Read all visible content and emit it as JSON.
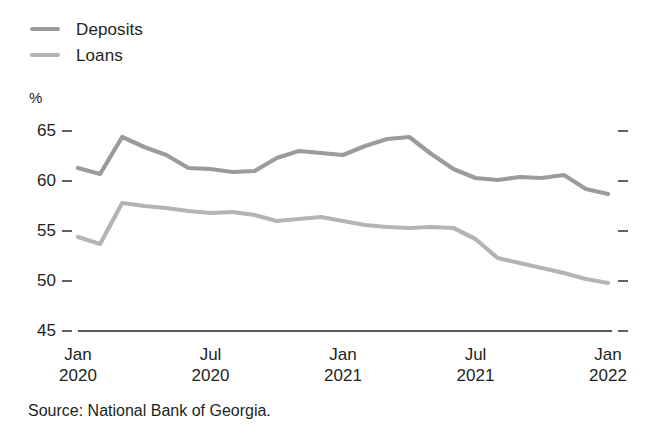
{
  "chart_data": {
    "type": "line",
    "title": "",
    "subtitle": "",
    "xlabel": "",
    "ylabel": "%",
    "unit_label": "%",
    "ylim": [
      45,
      65
    ],
    "yticks": [
      45,
      50,
      55,
      60,
      65
    ],
    "ytick_labels": [
      "45",
      "50",
      "55",
      "60",
      "65"
    ],
    "grid": false,
    "legend_position": "top-left",
    "right_axis_ticks": true,
    "x": [
      "Jan 2020",
      "Feb 2020",
      "Mar 2020",
      "Apr 2020",
      "May 2020",
      "Jun 2020",
      "Jul 2020",
      "Aug 2020",
      "Sep 2020",
      "Oct 2020",
      "Nov 2020",
      "Dec 2020",
      "Jan 2021",
      "Feb 2021",
      "Mar 2021",
      "Apr 2021",
      "May 2021",
      "Jun 2021",
      "Jul 2021",
      "Aug 2021",
      "Sep 2021",
      "Oct 2021",
      "Nov 2021",
      "Dec 2021",
      "Jan 2022"
    ],
    "xticks": [
      {
        "month": "Jan",
        "year": "2020"
      },
      {
        "month": "Jul",
        "year": "2020"
      },
      {
        "month": "Jan",
        "year": "2021"
      },
      {
        "month": "Jul",
        "year": "2021"
      },
      {
        "month": "Jan",
        "year": "2022"
      }
    ],
    "series": [
      {
        "name": "Deposits",
        "color": "#9b9b9b",
        "values": [
          61.3,
          60.7,
          64.4,
          63.4,
          62.6,
          61.3,
          61.2,
          60.9,
          61.0,
          62.3,
          63.0,
          62.8,
          62.6,
          63.5,
          64.2,
          64.4,
          62.7,
          61.2,
          60.3,
          60.1,
          60.4,
          60.3,
          60.6,
          59.2,
          58.7
        ]
      },
      {
        "name": "Loans",
        "color": "#b4b4b4",
        "values": [
          54.4,
          53.7,
          57.8,
          57.5,
          57.3,
          57.0,
          56.8,
          56.9,
          56.6,
          56.0,
          56.2,
          56.4,
          56.0,
          55.6,
          55.4,
          55.3,
          55.4,
          55.3,
          54.2,
          52.3,
          51.8,
          51.3,
          50.8,
          50.2,
          49.8
        ]
      }
    ]
  },
  "legend": {
    "items": [
      {
        "label": "Deposits",
        "color": "#9b9b9b"
      },
      {
        "label": "Loans",
        "color": "#b4b4b4"
      }
    ]
  },
  "footer": {
    "source": "Source: National Bank of Georgia."
  },
  "colors": {
    "deposits": "#9b9b9b",
    "loans": "#b4b4b4",
    "axis": "#231f20",
    "text": "#231f20",
    "background": "#ffffff"
  }
}
